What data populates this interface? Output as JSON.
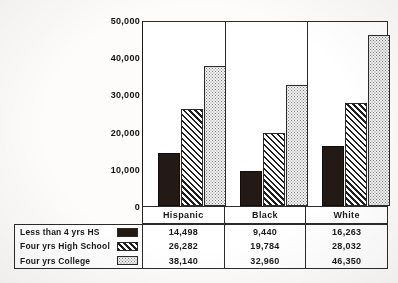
{
  "chart_data": {
    "type": "bar",
    "title": "",
    "subtitle": "",
    "xlabel": "",
    "ylabel": "",
    "categories": [
      "Hispanic",
      "Black",
      "White"
    ],
    "series": [
      {
        "name": "Less than 4 yrs HS",
        "pattern": "solid-dark",
        "values": [
          14498,
          9440,
          16263
        ],
        "labels": [
          "14,498",
          "9,440",
          "16,263"
        ]
      },
      {
        "name": "Four yrs High School",
        "pattern": "diagonal-hatch",
        "values": [
          26282,
          19784,
          28032
        ],
        "labels": [
          "26,282",
          "19,784",
          "28,032"
        ]
      },
      {
        "name": "Four yrs College",
        "pattern": "dotted-light",
        "values": [
          38140,
          32960,
          46350
        ],
        "labels": [
          "38,140",
          "32,960",
          "46,350"
        ]
      }
    ],
    "ylim": [
      0,
      50000
    ],
    "ytick_values": [
      0,
      10000,
      20000,
      30000,
      40000,
      50000
    ],
    "ytick_labels": [
      "0",
      "10,000",
      "20,000",
      "30,000",
      "40,000",
      "50,000"
    ],
    "grid": false,
    "legend_position": "bottom-table",
    "colors": {
      "solid_dark": "#231a16",
      "hatch_line": "#1f1f1f",
      "dots_fill": "#f3f3f3",
      "axis": "#2b2b2b",
      "background": "#ffffff"
    }
  },
  "axis": {
    "ticks": [
      {
        "label": "50,000",
        "value": 50000
      },
      {
        "label": "40,000",
        "value": 40000
      },
      {
        "label": "30,000",
        "value": 30000
      },
      {
        "label": "20,000",
        "value": 20000
      },
      {
        "label": "10,000",
        "value": 10000
      },
      {
        "label": "0",
        "value": 0
      }
    ]
  },
  "categories": [
    {
      "label": "Hispanic"
    },
    {
      "label": "Black"
    },
    {
      "label": "White"
    }
  ],
  "legend": {
    "rows": [
      {
        "label": "Less than 4 yrs HS"
      },
      {
        "label": "Four yrs High School"
      },
      {
        "label": "Four yrs College"
      }
    ]
  },
  "table": {
    "columns": [
      "Hispanic",
      "Black",
      "White"
    ],
    "rows": [
      {
        "label": "Less than 4 yrs HS",
        "cells": [
          "14,498",
          "9,440",
          "16,263"
        ]
      },
      {
        "label": "Four yrs High School",
        "cells": [
          "26,282",
          "19,784",
          "28,032"
        ]
      },
      {
        "label": "Four yrs College",
        "cells": [
          "38,140",
          "32,960",
          "46,350"
        ]
      }
    ]
  }
}
